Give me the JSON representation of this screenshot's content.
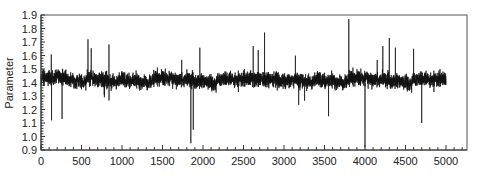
{
  "chart_data": {
    "type": "line",
    "title": "",
    "xlabel": "",
    "ylabel": "Parameter",
    "xlim": [
      0,
      5250
    ],
    "ylim": [
      0.9,
      1.9
    ],
    "grid": false,
    "legend": null,
    "x_ticks": [
      0,
      500,
      1000,
      1500,
      2000,
      2500,
      3000,
      3500,
      4000,
      4500,
      5000
    ],
    "x_tick_labels": [
      "0",
      "500",
      "1000",
      "1500",
      "2000",
      "2500",
      "3000",
      "3500",
      "4000",
      "4500",
      "5000"
    ],
    "x_minor_step": 100,
    "y_ticks": [
      0.9,
      1.0,
      1.1,
      1.2,
      1.3,
      1.4,
      1.5,
      1.6,
      1.7,
      1.8,
      1.9
    ],
    "y_tick_labels": [
      "0.9",
      "1.0",
      "1.1",
      "1.2",
      "1.3",
      "1.4",
      "1.5",
      "1.6",
      "1.7",
      "1.8",
      "1.9"
    ],
    "y_minor_step": 0.02,
    "series": [
      {
        "name": "Parameter",
        "color": "#111111",
        "n_points": 5000,
        "mean": 1.43,
        "band_low": 1.33,
        "band_high": 1.53,
        "notable_points": [
          {
            "x": 580,
            "y": 1.72
          },
          {
            "x": 130,
            "y": 1.12
          },
          {
            "x": 260,
            "y": 1.13
          },
          {
            "x": 1850,
            "y": 0.95
          },
          {
            "x": 1880,
            "y": 1.05
          },
          {
            "x": 2620,
            "y": 1.67
          },
          {
            "x": 2760,
            "y": 1.77
          },
          {
            "x": 3800,
            "y": 1.87
          },
          {
            "x": 4000,
            "y": 0.92
          },
          {
            "x": 4300,
            "y": 1.73
          },
          {
            "x": 4220,
            "y": 1.67
          },
          {
            "x": 4700,
            "y": 1.1
          },
          {
            "x": 3550,
            "y": 1.15
          },
          {
            "x": 4600,
            "y": 1.65
          }
        ]
      }
    ]
  }
}
